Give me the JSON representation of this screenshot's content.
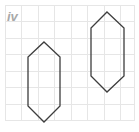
{
  "figure": {
    "label": "iv",
    "label_color": "#a8a8a8",
    "label_x": 7,
    "label_y": 21,
    "background_color": "#ffffff",
    "width": 139,
    "height": 132
  },
  "grid": {
    "color": "#e6e6e6",
    "cell_size": 16.5,
    "origin_x": 5,
    "origin_y": 5,
    "columns": 8,
    "rows": 7,
    "x_positions": [
      5,
      21.5,
      38,
      54.5,
      71,
      87.5,
      104,
      120.5,
      134
    ],
    "y_positions": [
      5,
      21.5,
      38,
      54.5,
      71,
      87.5,
      104,
      120.5
    ]
  },
  "shapes": [
    {
      "name": "left-hexagon",
      "type": "hexagon",
      "stroke_color": "#3d3d3d",
      "stroke_width": 1.3,
      "fill": "none",
      "points": "44,42 60,57 60,106 44,122 28,106 28,57",
      "vertices": [
        {
          "x": 44,
          "y": 42
        },
        {
          "x": 60,
          "y": 57
        },
        {
          "x": 60,
          "y": 106
        },
        {
          "x": 44,
          "y": 122
        },
        {
          "x": 28,
          "y": 106
        },
        {
          "x": 28,
          "y": 57
        }
      ]
    },
    {
      "name": "right-hexagon",
      "type": "hexagon",
      "stroke_color": "#3d3d3d",
      "stroke_width": 1.3,
      "fill": "none",
      "points": "107,12 124,28 124,76 107,92 91,76 91,28",
      "vertices": [
        {
          "x": 107,
          "y": 12
        },
        {
          "x": 124,
          "y": 28
        },
        {
          "x": 124,
          "y": 76
        },
        {
          "x": 107,
          "y": 92
        },
        {
          "x": 91,
          "y": 76
        },
        {
          "x": 91,
          "y": 28
        }
      ]
    }
  ]
}
